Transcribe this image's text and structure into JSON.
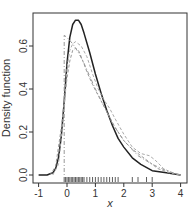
{
  "chart_data": {
    "type": "line",
    "title": "",
    "xlabel": "x",
    "ylabel": "Density function",
    "xlim": [
      -1.2,
      4.2
    ],
    "ylim": [
      -0.02,
      0.77
    ],
    "xticks": [
      -1,
      0,
      1,
      2,
      3,
      4
    ],
    "yticks": [
      0.0,
      0.2,
      0.4,
      0.6
    ],
    "xtick_labels": [
      "-1",
      "0",
      "1",
      "2",
      "3",
      "4"
    ],
    "ytick_labels": [
      "0.0",
      "0.2",
      "0.4",
      "0.6"
    ],
    "grid": false,
    "legend": null,
    "series": [
      {
        "name": "density-solid",
        "style": "solid",
        "color": "#222222",
        "x": [
          -1.0,
          -0.7,
          -0.5,
          -0.4,
          -0.3,
          -0.2,
          -0.1,
          0.0,
          0.1,
          0.2,
          0.3,
          0.4,
          0.5,
          0.6,
          0.8,
          1.0,
          1.2,
          1.4,
          1.6,
          1.8,
          2.0,
          2.3,
          2.6,
          3.0,
          3.5,
          4.0
        ],
        "y": [
          0.0,
          0.0,
          0.01,
          0.03,
          0.08,
          0.18,
          0.34,
          0.52,
          0.64,
          0.7,
          0.72,
          0.72,
          0.7,
          0.66,
          0.57,
          0.47,
          0.38,
          0.3,
          0.23,
          0.17,
          0.13,
          0.08,
          0.05,
          0.02,
          0.01,
          0.0
        ]
      },
      {
        "name": "density-dashed-1",
        "style": "dashed",
        "color": "#999999",
        "x": [
          -0.6,
          -0.4,
          -0.2,
          0.0,
          0.1,
          0.2,
          0.3,
          0.4,
          0.5,
          0.7,
          0.9,
          1.1,
          1.3,
          1.5,
          1.7,
          2.0,
          2.3,
          2.6,
          2.9,
          3.2,
          3.6,
          4.0
        ],
        "y": [
          0.0,
          0.04,
          0.22,
          0.45,
          0.53,
          0.58,
          0.59,
          0.58,
          0.55,
          0.48,
          0.42,
          0.37,
          0.32,
          0.27,
          0.22,
          0.16,
          0.12,
          0.09,
          0.06,
          0.03,
          0.01,
          0.0
        ]
      },
      {
        "name": "density-dashed-2",
        "style": "dashed",
        "color": "#aaaaaa",
        "x": [
          -0.5,
          -0.3,
          -0.1,
          0.0,
          0.1,
          0.2,
          0.3,
          0.5,
          0.7,
          0.9,
          1.1,
          1.3,
          1.5,
          1.7,
          2.0,
          2.3,
          2.6,
          2.9,
          3.1,
          3.4,
          3.7,
          4.0
        ],
        "y": [
          0.0,
          0.05,
          0.3,
          0.5,
          0.58,
          0.61,
          0.62,
          0.6,
          0.55,
          0.47,
          0.4,
          0.35,
          0.31,
          0.26,
          0.19,
          0.13,
          0.1,
          0.09,
          0.07,
          0.03,
          0.01,
          0.0
        ]
      },
      {
        "name": "density-dotdash-boundary",
        "style": "dotdash",
        "color": "#999999",
        "x": [
          -0.1,
          -0.1,
          0.0,
          0.2,
          0.4,
          0.6,
          0.8,
          1.0,
          1.3,
          1.6,
          2.0,
          2.5,
          3.0,
          3.5,
          4.0
        ],
        "y": [
          0.0,
          0.65,
          0.64,
          0.61,
          0.57,
          0.52,
          0.46,
          0.4,
          0.32,
          0.24,
          0.16,
          0.09,
          0.05,
          0.02,
          0.0
        ]
      }
    ],
    "rug": [
      -0.1,
      -0.05,
      0.0,
      0.05,
      0.1,
      0.15,
      0.2,
      0.25,
      0.3,
      0.35,
      0.4,
      0.45,
      0.5,
      0.55,
      0.6,
      0.7,
      0.8,
      0.9,
      1.0,
      1.1,
      1.2,
      1.3,
      1.4,
      1.5,
      1.6,
      1.7,
      1.8,
      2.3,
      2.5,
      2.8,
      3.0
    ]
  }
}
